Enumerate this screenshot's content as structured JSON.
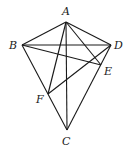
{
  "diagram": {
    "type": "geometry",
    "points": {
      "A": {
        "label": "A",
        "x": 66,
        "y": 22,
        "lx": 62,
        "ly": 14
      },
      "B": {
        "label": "B",
        "x": 22,
        "y": 45,
        "lx": 9,
        "ly": 49
      },
      "D": {
        "label": "D",
        "x": 111,
        "y": 45,
        "lx": 114,
        "ly": 49
      },
      "E": {
        "label": "E",
        "x": 101,
        "y": 65,
        "lx": 104,
        "ly": 75
      },
      "F": {
        "label": "F",
        "x": 48,
        "y": 94,
        "lx": 36,
        "ly": 103
      },
      "C": {
        "label": "C",
        "x": 67,
        "y": 130,
        "lx": 62,
        "ly": 145
      }
    },
    "segments": [
      [
        "A",
        "B"
      ],
      [
        "A",
        "D"
      ],
      [
        "A",
        "C"
      ],
      [
        "A",
        "E"
      ],
      [
        "A",
        "F"
      ],
      [
        "B",
        "D"
      ],
      [
        "B",
        "E"
      ],
      [
        "B",
        "C"
      ],
      [
        "D",
        "C"
      ],
      [
        "D",
        "F"
      ]
    ]
  }
}
